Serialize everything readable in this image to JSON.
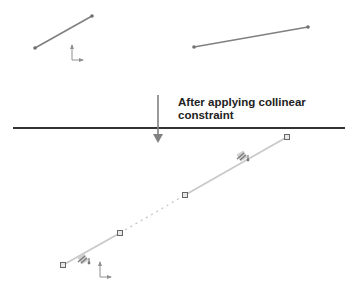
{
  "caption": {
    "line1": "After applying collinear",
    "line2": "constraint"
  },
  "colors": {
    "line_before": "#808080",
    "line_after": "#c8c8c8",
    "point": "#707070",
    "divider": "#333333",
    "arrow": "#808080",
    "axis": "#909090",
    "handle_fill": "#e8e8e8",
    "handle_stroke": "#666666",
    "glyph": "#777777"
  },
  "before": {
    "lines": [
      {
        "name": "line-1",
        "x1": 35,
        "y1": 48,
        "x2": 92,
        "y2": 16
      },
      {
        "name": "line-2",
        "x1": 194,
        "y1": 47,
        "x2": 308,
        "y2": 27
      }
    ],
    "axis_icon": {
      "x": 72,
      "y": 60,
      "len_up": 15,
      "len_right": 11
    }
  },
  "divider": {
    "x1": 13,
    "x2": 345,
    "y": 128
  },
  "arrow": {
    "x": 158,
    "y1": 95,
    "y2": 143
  },
  "after": {
    "points": [
      {
        "x": 63,
        "y": 265
      },
      {
        "x": 120,
        "y": 233
      },
      {
        "x": 185,
        "y": 195
      },
      {
        "x": 287,
        "y": 137
      }
    ],
    "solid_segments": [
      [
        0,
        1
      ],
      [
        2,
        3
      ]
    ],
    "dashed_segments": [
      [
        1,
        2
      ]
    ],
    "constraint_glyphs": [
      {
        "name": "collinear-constraint-icon-1",
        "x": 244,
        "y": 157
      },
      {
        "name": "collinear-constraint-icon-2",
        "x": 85,
        "y": 260
      }
    ],
    "axis_icon": {
      "x": 100,
      "y": 277,
      "len_up": 15,
      "len_right": 11
    }
  }
}
